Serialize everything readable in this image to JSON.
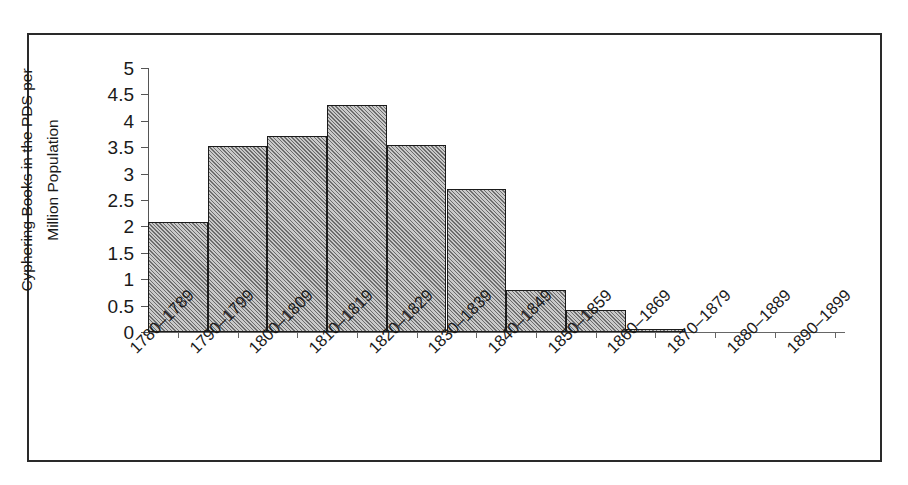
{
  "chart_data": {
    "type": "bar",
    "title": "",
    "xlabel": "Decade",
    "ylabel": "Cyphering Books in the PDS per Million Population",
    "ylabel_lines": [
      "Cyphering Books in the PDS per",
      "Million Population"
    ],
    "categories": [
      "1780–1789",
      "1790–1799",
      "1800–1809",
      "1810–1819",
      "1820–1829",
      "1830–1839",
      "1840–1849",
      "1850–1859",
      "1860–1869",
      "1870–1879",
      "1880–1889",
      "1890–1899"
    ],
    "values": [
      2.08,
      3.52,
      3.72,
      4.3,
      3.54,
      2.71,
      0.8,
      0.42,
      0.06,
      0,
      0,
      0
    ],
    "ylim": [
      0,
      5
    ],
    "ytick_values": [
      0,
      0.5,
      1,
      1.5,
      2,
      2.5,
      3,
      3.5,
      4,
      4.5,
      5
    ],
    "ytick_labels": [
      "0",
      "0.5",
      "1",
      "1.5",
      "2",
      "2.5",
      "3",
      "3.5",
      "4",
      "4.5",
      "5"
    ],
    "grid": false,
    "legend": false,
    "legend_position": "none",
    "bar_gap": 0,
    "bar_fill_color": "#9a9a9a",
    "bar_hatch": "diagonal-forward-slash",
    "bar_edge_color": "#1b1b1b",
    "axis_color": "#555555",
    "background_color": "#ffffff",
    "frame_border_color": "#2a2a2a",
    "n_bars_with_data": 9
  }
}
